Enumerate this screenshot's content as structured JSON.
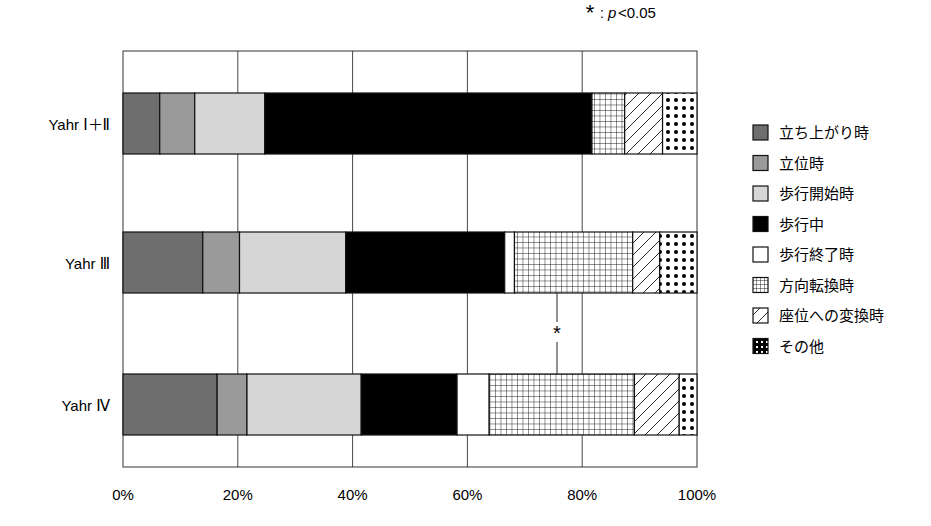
{
  "chart_data": {
    "type": "bar",
    "orientation": "horizontal",
    "stacked": true,
    "percent": true,
    "title": "",
    "annotation": "*: p<0.05",
    "annotation_parts": {
      "star": "*",
      "colon": ":",
      "p": "p",
      "rest": "<0.05"
    },
    "xlabel": "",
    "ylabel": "",
    "xlim": [
      0,
      100
    ],
    "x_ticks": [
      "0%",
      "20%",
      "40%",
      "60%",
      "80%",
      "100%"
    ],
    "grid": true,
    "legend_position": "right",
    "categories": [
      "Yahr I + II",
      "Yahr III",
      "Yahr IV"
    ],
    "category_labels": [
      "Yahr Ⅰ＋Ⅱ",
      "Yahr Ⅲ",
      "Yahr Ⅳ"
    ],
    "series": [
      {
        "name": "立ち上がり時",
        "pattern": "solid",
        "color": "#6e6e6e",
        "values": [
          6.4,
          13.9,
          16.4
        ]
      },
      {
        "name": "立位時",
        "pattern": "solid",
        "color": "#9a9a9a",
        "values": [
          6.1,
          6.4,
          5.2
        ]
      },
      {
        "name": "歩行開始時",
        "pattern": "solid",
        "color": "#d6d6d6",
        "values": [
          12.2,
          18.5,
          19.9
        ]
      },
      {
        "name": "歩行中",
        "pattern": "solid",
        "color": "#000000",
        "values": [
          57.0,
          27.7,
          16.7
        ]
      },
      {
        "name": "歩行終了時",
        "pattern": "solid",
        "color": "#ffffff",
        "values": [
          0.0,
          1.7,
          5.6
        ]
      },
      {
        "name": "方向転換時",
        "pattern": "grid",
        "color": "#ffffff",
        "values": [
          5.7,
          20.6,
          25.3
        ]
      },
      {
        "name": "座位への変換時",
        "pattern": "diagonal",
        "color": "#ffffff",
        "values": [
          6.6,
          4.7,
          7.8
        ]
      },
      {
        "name": "その他",
        "pattern": "dots",
        "color": "#ffffff",
        "values": [
          6.0,
          6.5,
          3.1
        ]
      }
    ],
    "significance": [
      {
        "between": [
          "Yahr III",
          "Yahr IV"
        ],
        "series": "方向転換時",
        "label": "*"
      }
    ]
  }
}
